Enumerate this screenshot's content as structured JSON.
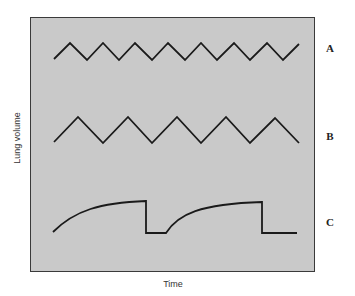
{
  "figure": {
    "ylabel": "Lung volume",
    "xlabel": "Time",
    "colors": {
      "panel_bg": "#c9c9c9",
      "trace": "#1a1a1a",
      "frame": "#3a3a3a"
    },
    "traces": [
      {
        "label": "A",
        "shape": "zigzag",
        "description": "rapid, shallow breathing (short period triangle wave)",
        "points": "54,59 70,43 87,60 103,43 119,60 135,43 152,60 168,43 185,60 201,43 217,60 234,43 250,60 267,43 283,60 299,44"
      },
      {
        "label": "B",
        "shape": "zigzag",
        "description": "slower, deeper breathing (longer period triangle wave)",
        "points": "54,142 78,117 103,143 128,117 152,143 177,117 201,143 226,117 250,143 275,118 299,143"
      },
      {
        "label": "C",
        "shape": "exponential-rise-with-drop",
        "description": "curved rise, abrupt drop, flat baseline, repeated",
        "path": "M53,232 C75,210 100,203 146,201 L146,233 L166,233 C178,214 200,204 262,202 L262,233 L297,233"
      }
    ]
  }
}
